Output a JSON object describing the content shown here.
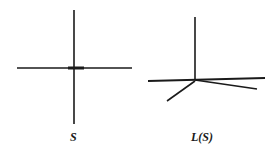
{
  "figure": {
    "left": {
      "label": "S",
      "description": "cross: vertical line crossing horizontal line",
      "lines": [
        {
          "x1": 74,
          "y1": 10,
          "x2": 74,
          "y2": 124,
          "w": 1.6
        },
        {
          "x1": 17,
          "y1": 68,
          "x2": 132,
          "y2": 68,
          "w": 1.4
        },
        {
          "x1": 68,
          "y1": 68,
          "x2": 84,
          "y2": 68,
          "w": 3
        }
      ]
    },
    "right": {
      "label": "L(S)",
      "description": "link of S: vertical ray, nearly horizontal line, and two rays descending from junction",
      "lines": [
        {
          "x1": 195,
          "y1": 17,
          "x2": 195,
          "y2": 80,
          "w": 1.6
        },
        {
          "x1": 148,
          "y1": 81,
          "x2": 265,
          "y2": 78,
          "w": 2.2
        },
        {
          "x1": 195,
          "y1": 80,
          "x2": 257,
          "y2": 89,
          "w": 1.6
        },
        {
          "x1": 195,
          "y1": 81,
          "x2": 167,
          "y2": 101,
          "w": 1.6
        }
      ]
    },
    "stroke_color": "#1a1a1a"
  }
}
